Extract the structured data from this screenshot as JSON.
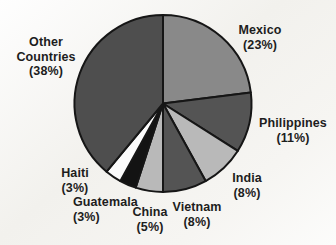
{
  "chart_data": {
    "type": "pie",
    "title": "",
    "legend_position": "none",
    "start_angle_deg": 0,
    "direction": "clockwise",
    "outline_color": "#161616",
    "value_unit": "percent",
    "slices": [
      {
        "name": "Mexico",
        "value": 23,
        "color": "#898989",
        "label_lines": [
          "Mexico",
          "(23%)"
        ]
      },
      {
        "name": "Philippines",
        "value": 11,
        "color": "#545454",
        "label_lines": [
          "Philippines",
          "(11%)"
        ]
      },
      {
        "name": "India",
        "value": 8,
        "color": "#b9b9b9",
        "label_lines": [
          "India",
          "(8%)"
        ]
      },
      {
        "name": "Vietnam",
        "value": 8,
        "color": "#545454",
        "label_lines": [
          "Vietnam",
          "(8%)"
        ]
      },
      {
        "name": "China",
        "value": 5,
        "color": "#b9b9b9",
        "label_lines": [
          "China",
          "(5%)"
        ]
      },
      {
        "name": "Guatemala",
        "value": 3,
        "color": "#131313",
        "label_lines": [
          "Guatemala",
          "(3%)"
        ]
      },
      {
        "name": "Haiti",
        "value": 3,
        "color": "#fbfbfb",
        "label_lines": [
          "Haiti",
          "(3%)"
        ]
      },
      {
        "name": "Other Countries",
        "value": 38,
        "color": "#4e4e4e",
        "label_lines": [
          "Other",
          "Countries",
          "(38%)"
        ]
      }
    ]
  }
}
